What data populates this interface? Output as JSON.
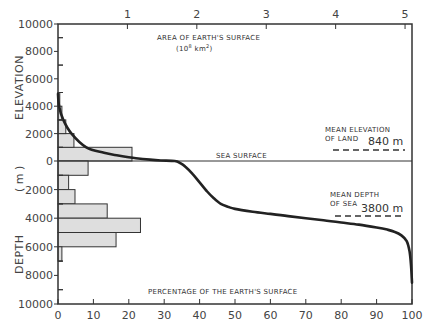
{
  "chart_data": {
    "type": "bar",
    "title": "",
    "top_axis": {
      "label": "AREA OF EARTH'S SURFACE",
      "sublabel": "(10^8 km^2)",
      "sublabel_parts": {
        "open": "(10",
        "exp1": "8",
        "unit": " km",
        "exp2": "2",
        "close": ")"
      },
      "ticks": [
        1,
        2,
        3,
        4,
        5
      ],
      "range": [
        0,
        5.1
      ]
    },
    "bottom_axis": {
      "label": "PERCENTAGE OF THE EARTH'S SURFACE",
      "ticks": [
        0,
        10,
        20,
        30,
        40,
        50,
        60,
        70,
        80,
        90,
        100
      ],
      "range": [
        0,
        100
      ]
    },
    "left_axis": {
      "elevation_label": "ELEVATION",
      "unit_label": "( m )",
      "depth_label": "DEPTH",
      "ticks": [
        {
          "value": 10000,
          "label": "10000"
        },
        {
          "value": 8000,
          "label": "8000"
        },
        {
          "value": 6000,
          "label": "6000"
        },
        {
          "value": 4000,
          "label": "4000"
        },
        {
          "value": 2000,
          "label": "2000"
        },
        {
          "value": 0,
          "label": "0"
        },
        {
          "value": -2000,
          "label": "2000"
        },
        {
          "value": -4000,
          "label": "4000"
        },
        {
          "value": -6000,
          "label": "6000"
        },
        {
          "value": -8000,
          "label": "8000"
        },
        {
          "value": -10000,
          "label": "10000"
        }
      ],
      "range": [
        -10000,
        10000
      ]
    },
    "histogram": {
      "bin_size_m": 1000,
      "land": [
        {
          "from": 0,
          "to": 1000,
          "percent": 20.9
        },
        {
          "from": 1000,
          "to": 2000,
          "percent": 4.5
        },
        {
          "from": 2000,
          "to": 3000,
          "percent": 2.2
        },
        {
          "from": 3000,
          "to": 4000,
          "percent": 1.1
        },
        {
          "from": 4000,
          "to": 5000,
          "percent": 0.5
        }
      ],
      "sea": [
        {
          "from": 0,
          "to": -1000,
          "percent": 8.5
        },
        {
          "from": -1000,
          "to": -2000,
          "percent": 3.0
        },
        {
          "from": -2000,
          "to": -3000,
          "percent": 4.8
        },
        {
          "from": -3000,
          "to": -4000,
          "percent": 13.9
        },
        {
          "from": -4000,
          "to": -5000,
          "percent": 23.3
        },
        {
          "from": -5000,
          "to": -6000,
          "percent": 16.4
        },
        {
          "from": -6000,
          "to": -7000,
          "percent": 1.1
        }
      ]
    },
    "hypsometric_curve": {
      "x_percent": [
        0,
        0.3,
        1.5,
        3.8,
        8,
        13,
        17,
        22,
        26,
        29,
        33,
        34.5,
        36,
        38,
        40,
        42,
        44,
        46,
        48,
        50,
        55,
        60,
        65,
        70,
        75,
        80,
        85,
        90,
        93,
        95,
        97,
        98.5,
        99.3,
        99.7,
        100
      ],
      "y_elevation_m": [
        4900,
        4000,
        3000,
        2000,
        1000,
        600,
        400,
        200,
        100,
        40,
        0,
        -150,
        -400,
        -900,
        -1500,
        -2100,
        -2600,
        -3000,
        -3200,
        -3350,
        -3550,
        -3700,
        -3850,
        -4000,
        -4150,
        -4300,
        -4450,
        -4650,
        -4800,
        -4950,
        -5200,
        -5600,
        -6300,
        -7200,
        -8500
      ]
    },
    "annotations": {
      "sea_surface": "SEA SURFACE",
      "mean_elevation_label_1": "MEAN ELEVATION",
      "mean_elevation_label_2": "OF LAND",
      "mean_elevation_value": "840 m",
      "mean_elevation_m": 840,
      "mean_depth_label_1": "MEAN DEPTH",
      "mean_depth_label_2": "OF SEA",
      "mean_depth_value": "3800 m",
      "mean_depth_m": -3800
    },
    "colors": {
      "bar_fill": "#dedede",
      "line": "#222222",
      "axis": "#333333"
    }
  }
}
